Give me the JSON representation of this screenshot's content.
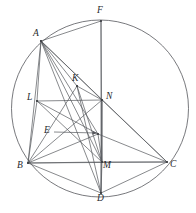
{
  "figure": {
    "width": 196,
    "height": 213,
    "background_color": "#ffffff",
    "stroke_color": "#55575c",
    "label_color": "#27292d"
  },
  "circle": {
    "name": "circumcircle",
    "cx": 100,
    "cy": 108.5,
    "r": 88.5
  },
  "points": [
    {
      "id": "A",
      "label": "A",
      "x": 41,
      "y": 41,
      "label_x": 33,
      "label_y": 29
    },
    {
      "id": "F",
      "label": "F",
      "x": 101,
      "y": 21,
      "label_x": 97,
      "label_y": 6
    },
    {
      "id": "K",
      "label": "K",
      "x": 77,
      "y": 86,
      "label_x": 72,
      "label_y": 74
    },
    {
      "id": "N",
      "label": "N",
      "x": 102,
      "y": 100,
      "label_x": 106,
      "label_y": 92
    },
    {
      "id": "L",
      "label": "L",
      "x": 37,
      "y": 101,
      "label_x": 27,
      "label_y": 93
    },
    {
      "id": "E",
      "label": "E",
      "x": 98,
      "y": 134,
      "label_x": 44,
      "label_y": 126
    },
    {
      "id": "B",
      "label": "B",
      "x": 28,
      "y": 163,
      "label_x": 17,
      "label_y": 161
    },
    {
      "id": "M",
      "label": "M",
      "x": 102,
      "y": 162,
      "label_x": 103,
      "label_y": 161
    },
    {
      "id": "C",
      "label": "C",
      "x": 167,
      "y": 162,
      "label_x": 170,
      "label_y": 160
    },
    {
      "id": "D",
      "label": "D",
      "x": 101,
      "y": 193,
      "label_x": 97,
      "label_y": 194
    }
  ],
  "segments": [
    {
      "name": "segment-A-B",
      "from": "A",
      "to": "B"
    },
    {
      "name": "segment-A-C",
      "from": "A",
      "to": "C"
    },
    {
      "name": "segment-A-F",
      "from": "A",
      "to": "F"
    },
    {
      "name": "segment-A-L",
      "from": "A",
      "to": "L"
    },
    {
      "name": "segment-A-K",
      "from": "A",
      "to": "K"
    },
    {
      "name": "segment-A-N",
      "from": "A",
      "to": "N"
    },
    {
      "name": "segment-A-E",
      "from": "A",
      "to": "E"
    },
    {
      "name": "segment-A-M",
      "from": "A",
      "to": "M"
    },
    {
      "name": "segment-A-D",
      "from": "A",
      "to": "D"
    },
    {
      "name": "segment-B-C",
      "from": "B",
      "to": "C"
    },
    {
      "name": "segment-B-D",
      "from": "B",
      "to": "D"
    },
    {
      "name": "segment-D-C",
      "from": "D",
      "to": "C"
    },
    {
      "name": "segment-B-L",
      "from": "B",
      "to": "L"
    },
    {
      "name": "segment-L-N",
      "from": "L",
      "to": "N"
    },
    {
      "name": "segment-L-M",
      "from": "L",
      "to": "M"
    },
    {
      "name": "segment-L-E",
      "from": "L",
      "to": "E"
    },
    {
      "name": "segment-B-N",
      "from": "B",
      "to": "N"
    },
    {
      "name": "segment-B-K",
      "from": "B",
      "to": "K"
    },
    {
      "name": "segment-B-E",
      "from": "B",
      "to": "E"
    },
    {
      "name": "segment-N-M",
      "from": "N",
      "to": "M"
    },
    {
      "name": "segment-N-C",
      "from": "N",
      "to": "C"
    },
    {
      "name": "segment-N-D",
      "from": "N",
      "to": "D"
    },
    {
      "name": "segment-K-M",
      "from": "K",
      "to": "M"
    },
    {
      "name": "segment-K-D",
      "from": "K",
      "to": "D"
    },
    {
      "name": "segment-K-N",
      "from": "K",
      "to": "N"
    },
    {
      "name": "segment-E-M",
      "from": "E",
      "to": "M"
    },
    {
      "name": "segment-E-C",
      "from": "E",
      "to": "C"
    },
    {
      "name": "segment-F-M",
      "from": "F",
      "to": "M"
    },
    {
      "name": "segment-F-D",
      "from": "F",
      "to": "D"
    },
    {
      "name": "segment-M-C",
      "from": "M",
      "to": "C"
    },
    {
      "name": "segment-M-D",
      "from": "M",
      "to": "D"
    },
    {
      "name": "segment-B-M",
      "from": "B",
      "to": "M"
    }
  ],
  "annotations": [
    {
      "name": "pointer-arrow-E",
      "from_x": 54,
      "from_y": 132,
      "to_x": 97,
      "to_y": 133
    }
  ]
}
